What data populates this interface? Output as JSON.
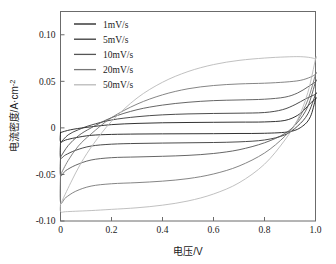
{
  "chart_data": {
    "type": "line",
    "title": "",
    "xlabel": "电压/V",
    "ylabel": "电流密度/A·cm⁻²",
    "xlim": [
      0,
      1.0
    ],
    "ylim": [
      -0.1,
      0.125
    ],
    "xticks": [
      "0",
      "0.2",
      "0.4",
      "0.6",
      "0.8",
      "1.0"
    ],
    "xtick_values": [
      0,
      0.2,
      0.4,
      0.6,
      0.8,
      1.0
    ],
    "yticks": [
      "0.10",
      "0.05",
      "0",
      "-0.05",
      "-0.10"
    ],
    "ytick_values": [
      0.1,
      0.05,
      0,
      -0.05,
      -0.1
    ],
    "grid": false,
    "legend_position": "upper-left",
    "series": [
      {
        "name": "1mV/s",
        "color": "#1c1c1c",
        "forward": [
          [
            0.0,
            -0.005
          ],
          [
            0.04,
            -0.002
          ],
          [
            0.1,
            0.0005
          ],
          [
            0.2,
            0.0035
          ],
          [
            0.3,
            0.0048
          ],
          [
            0.4,
            0.0055
          ],
          [
            0.5,
            0.0058
          ],
          [
            0.6,
            0.006
          ],
          [
            0.7,
            0.0062
          ],
          [
            0.8,
            0.0064
          ],
          [
            0.88,
            0.008
          ],
          [
            0.93,
            0.0135
          ],
          [
            0.96,
            0.0205
          ],
          [
            0.98,
            0.0265
          ],
          [
            1.0,
            0.031
          ]
        ],
        "reverse": [
          [
            1.0,
            0.031
          ],
          [
            0.98,
            0.012
          ],
          [
            0.95,
            0.002
          ],
          [
            0.9,
            -0.004
          ],
          [
            0.8,
            -0.0058
          ],
          [
            0.7,
            -0.006
          ],
          [
            0.6,
            -0.0062
          ],
          [
            0.5,
            -0.0063
          ],
          [
            0.4,
            -0.0064
          ],
          [
            0.3,
            -0.0066
          ],
          [
            0.2,
            -0.007
          ],
          [
            0.12,
            -0.008
          ],
          [
            0.06,
            -0.0105
          ],
          [
            0.02,
            -0.013
          ],
          [
            0.0,
            -0.015
          ]
        ]
      },
      {
        "name": "5mV/s",
        "color": "#383838",
        "forward": [
          [
            0.0,
            -0.016
          ],
          [
            0.03,
            -0.0075
          ],
          [
            0.07,
            -0.002
          ],
          [
            0.12,
            0.003
          ],
          [
            0.2,
            0.0085
          ],
          [
            0.3,
            0.012
          ],
          [
            0.4,
            0.014
          ],
          [
            0.5,
            0.015
          ],
          [
            0.6,
            0.0155
          ],
          [
            0.7,
            0.0158
          ],
          [
            0.8,
            0.0165
          ],
          [
            0.87,
            0.0195
          ],
          [
            0.92,
            0.025
          ],
          [
            0.96,
            0.031
          ],
          [
            1.0,
            0.036
          ]
        ],
        "reverse": [
          [
            1.0,
            0.036
          ],
          [
            0.97,
            0.015
          ],
          [
            0.93,
            0.002
          ],
          [
            0.88,
            -0.0075
          ],
          [
            0.8,
            -0.013
          ],
          [
            0.7,
            -0.015
          ],
          [
            0.6,
            -0.0157
          ],
          [
            0.5,
            -0.016
          ],
          [
            0.4,
            -0.0163
          ],
          [
            0.3,
            -0.0167
          ],
          [
            0.2,
            -0.0175
          ],
          [
            0.12,
            -0.0195
          ],
          [
            0.06,
            -0.024
          ],
          [
            0.02,
            -0.029
          ],
          [
            0.0,
            -0.032
          ]
        ]
      },
      {
        "name": "10mV/s",
        "color": "#555555",
        "forward": [
          [
            0.0,
            -0.0315
          ],
          [
            0.03,
            -0.019
          ],
          [
            0.07,
            -0.0085
          ],
          [
            0.12,
            0.0
          ],
          [
            0.2,
            0.011
          ],
          [
            0.3,
            0.0195
          ],
          [
            0.4,
            0.0245
          ],
          [
            0.5,
            0.0275
          ],
          [
            0.6,
            0.0293
          ],
          [
            0.7,
            0.03
          ],
          [
            0.8,
            0.0308
          ],
          [
            0.88,
            0.033
          ],
          [
            0.93,
            0.0375
          ],
          [
            0.97,
            0.044
          ],
          [
            1.0,
            0.0495
          ]
        ],
        "reverse": [
          [
            1.0,
            0.0495
          ],
          [
            0.97,
            0.023
          ],
          [
            0.93,
            0.006
          ],
          [
            0.88,
            -0.006
          ],
          [
            0.8,
            -0.016
          ],
          [
            0.7,
            -0.0235
          ],
          [
            0.6,
            -0.0275
          ],
          [
            0.5,
            -0.0295
          ],
          [
            0.4,
            -0.0305
          ],
          [
            0.3,
            -0.0312
          ],
          [
            0.2,
            -0.032
          ],
          [
            0.12,
            -0.0345
          ],
          [
            0.06,
            -0.04
          ],
          [
            0.02,
            -0.046
          ],
          [
            0.0,
            -0.051
          ]
        ]
      },
      {
        "name": "20mV/s",
        "color": "#777777",
        "forward": [
          [
            0.0,
            -0.0505
          ],
          [
            0.03,
            -0.035
          ],
          [
            0.07,
            -0.0195
          ],
          [
            0.12,
            -0.0065
          ],
          [
            0.2,
            0.011
          ],
          [
            0.3,
            0.0255
          ],
          [
            0.4,
            0.0355
          ],
          [
            0.5,
            0.042
          ],
          [
            0.6,
            0.0455
          ],
          [
            0.7,
            0.0472
          ],
          [
            0.8,
            0.048
          ],
          [
            0.88,
            0.0492
          ],
          [
            0.94,
            0.051
          ],
          [
            0.98,
            0.0545
          ],
          [
            1.0,
            0.0575
          ]
        ],
        "reverse": [
          [
            1.0,
            0.0575
          ],
          [
            0.97,
            0.03
          ],
          [
            0.93,
            0.008
          ],
          [
            0.88,
            -0.009
          ],
          [
            0.8,
            -0.027
          ],
          [
            0.7,
            -0.041
          ],
          [
            0.6,
            -0.0495
          ],
          [
            0.5,
            -0.0545
          ],
          [
            0.4,
            -0.0572
          ],
          [
            0.3,
            -0.0588
          ],
          [
            0.2,
            -0.06
          ],
          [
            0.12,
            -0.0625
          ],
          [
            0.06,
            -0.068
          ],
          [
            0.02,
            -0.075
          ],
          [
            0.0,
            -0.08
          ]
        ]
      },
      {
        "name": "50mV/s",
        "color": "#b9b9b9",
        "forward": [
          [
            0.0,
            -0.082
          ],
          [
            0.04,
            -0.059
          ],
          [
            0.08,
            -0.038
          ],
          [
            0.13,
            -0.017
          ],
          [
            0.2,
            0.007
          ],
          [
            0.3,
            0.032
          ],
          [
            0.4,
            0.049
          ],
          [
            0.5,
            0.0605
          ],
          [
            0.6,
            0.068
          ],
          [
            0.7,
            0.0725
          ],
          [
            0.8,
            0.075
          ],
          [
            0.88,
            0.0762
          ],
          [
            0.94,
            0.0765
          ],
          [
            0.98,
            0.0755
          ],
          [
            1.0,
            0.074
          ]
        ],
        "reverse": [
          [
            1.0,
            0.074
          ],
          [
            0.97,
            0.038
          ],
          [
            0.93,
            0.009
          ],
          [
            0.88,
            -0.013
          ],
          [
            0.8,
            -0.039
          ],
          [
            0.7,
            -0.059
          ],
          [
            0.6,
            -0.071
          ],
          [
            0.5,
            -0.0785
          ],
          [
            0.4,
            -0.083
          ],
          [
            0.3,
            -0.0858
          ],
          [
            0.2,
            -0.0875
          ],
          [
            0.12,
            -0.0888
          ],
          [
            0.06,
            -0.0895
          ],
          [
            0.02,
            -0.09
          ],
          [
            0.0,
            -0.09
          ]
        ]
      }
    ]
  },
  "legend": {
    "items": [
      {
        "label": "1mV/s"
      },
      {
        "label": "5mV/s"
      },
      {
        "label": "10mV/s"
      },
      {
        "label": "20mV/s"
      },
      {
        "label": "50mV/s"
      }
    ]
  },
  "axes": {
    "x_title": "电压/V",
    "y_title": "电流密度/A·cm",
    "y_title_exponent": "-2"
  }
}
